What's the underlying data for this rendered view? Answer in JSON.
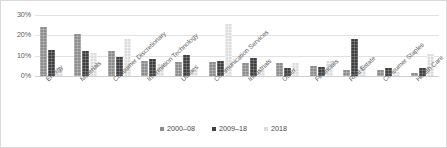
{
  "chart_data": {
    "type": "bar",
    "title": "",
    "subtitle": "",
    "xlabel": "",
    "ylabel": "",
    "ylim": [
      0,
      30
    ],
    "yticks": [
      "0%",
      "10%",
      "20%",
      "30%"
    ],
    "ytick_values": [
      0,
      10,
      20,
      30
    ],
    "grid": true,
    "legend_position": "bottom-center",
    "orientation": "vertical",
    "grouped": true,
    "categories": [
      "Energy",
      "Materials",
      "Consumer Discretionary",
      "Information Technology",
      "Utilities",
      "Communication Services",
      "Industrials",
      "Other",
      "Financials",
      "Real Estate",
      "Consumer Staples",
      "Health Care"
    ],
    "series": [
      {
        "name": "2000–08",
        "color": "#8d8d8d",
        "values": [
          24,
          20.5,
          12.5,
          7.5,
          7,
          7,
          6.5,
          6.5,
          5,
          3,
          3,
          1.5
        ]
      },
      {
        "name": "2009–18",
        "color": "#3f3f3f",
        "values": [
          13,
          12.5,
          9.5,
          8.5,
          10.5,
          7.5,
          9,
          4,
          4.5,
          18,
          4,
          4
        ]
      },
      {
        "name": "2018",
        "color": "#dcdcdc",
        "values": [
          4,
          11.5,
          18,
          6,
          3,
          25.5,
          3,
          6.5,
          7.5,
          5,
          2,
          11
        ]
      }
    ]
  },
  "legend": {
    "items": [
      {
        "label": "2000–08",
        "swatch": "legend-swatch-2000-08"
      },
      {
        "label": "2009–18",
        "swatch": "legend-swatch-2009-18"
      },
      {
        "label": "2018",
        "swatch": "legend-swatch-2018"
      }
    ]
  }
}
